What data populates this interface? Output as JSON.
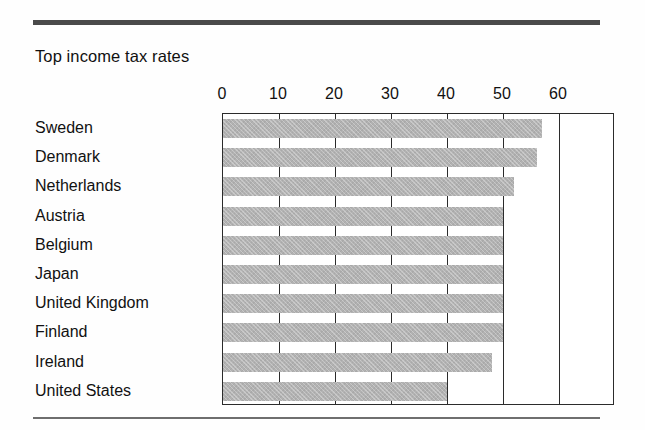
{
  "chart_data": {
    "type": "bar",
    "orientation": "horizontal",
    "title": "Top income tax rates",
    "xlabel": "",
    "ylabel": "",
    "xlim": [
      0,
      70
    ],
    "xticks": [
      0,
      10,
      20,
      30,
      40,
      50,
      60
    ],
    "tick_labels": [
      "0",
      "10",
      "20",
      "30",
      "40",
      "50",
      "60"
    ],
    "grid": "vertical gridlines at each labeled tick",
    "legend": "none",
    "bar_color": "#b2b2b2",
    "axis_color": "#2b2b2b",
    "categories": [
      "Sweden",
      "Denmark",
      "Netherlands",
      "Austria",
      "Belgium",
      "Japan",
      "United Kingdom",
      "Finland",
      "Ireland",
      "United States"
    ],
    "values": [
      57,
      56,
      52,
      50,
      50,
      50,
      50,
      50,
      48,
      40
    ]
  },
  "figure": {
    "title": "Top income tax rates",
    "top_rule": "thick-horizontal-rule",
    "bottom_rule": "thin-horizontal-rule"
  }
}
